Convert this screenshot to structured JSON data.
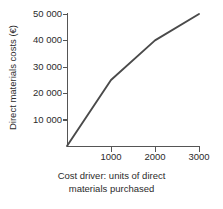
{
  "chart_data": {
    "type": "line",
    "title": "",
    "subtitle": "",
    "xlabel_line1": "Cost driver: units of direct",
    "xlabel_line2": "materials purchased",
    "xlabel": "Cost driver: units of direct materials purchased",
    "ylabel": "Direct materials costs (€)",
    "xlim": [
      0,
      3000
    ],
    "ylim": [
      0,
      50000
    ],
    "grid": false,
    "legend": "none",
    "x": [
      0,
      1000,
      2000,
      3000
    ],
    "values": [
      0,
      25000,
      40000,
      50000
    ],
    "series": [
      {
        "name": "Direct materials costs",
        "x": [
          0,
          1000,
          2000,
          3000
        ],
        "values": [
          0,
          25000,
          40000,
          50000
        ],
        "color": "#4a4a4a"
      }
    ],
    "x_ticks": [
      1000,
      2000,
      3000
    ],
    "x_ticklabels": [
      "1000",
      "2000",
      "3000"
    ],
    "y_ticks": [
      10000,
      20000,
      30000,
      40000,
      50000
    ],
    "y_ticklabels": [
      "10 000",
      "20 000",
      "30 000",
      "40 000",
      "50 000"
    ],
    "annotations": [],
    "colors": {
      "line": "#4a4a4a",
      "axis": "#555555",
      "text": "#2b2b2b",
      "background": "#ffffff"
    }
  }
}
